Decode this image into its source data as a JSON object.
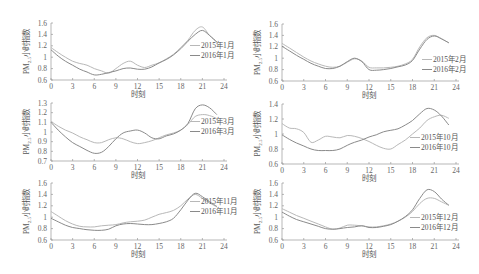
{
  "chart_data": [
    {
      "type": "line",
      "title": "",
      "xlabel": "时刻",
      "ylabel": "PM2.5小时指数",
      "ylim": [
        0.6,
        1.6
      ],
      "yticks": [
        "0.6",
        "0.8",
        "1",
        "1.2",
        "1.4",
        "1.6"
      ],
      "xlim": [
        0,
        24
      ],
      "xticks": [
        "0",
        "3",
        "6",
        "9",
        "12",
        "15",
        "18",
        "21",
        "24"
      ],
      "x": [
        0,
        1,
        2,
        3,
        4,
        5,
        6,
        7,
        8,
        9,
        10,
        11,
        12,
        13,
        14,
        15,
        16,
        17,
        18,
        19,
        20,
        21,
        22,
        23
      ],
      "series": [
        {
          "name": "2015年1月",
          "values": [
            1.17,
            1.08,
            1.0,
            0.93,
            0.89,
            0.86,
            0.8,
            0.76,
            0.72,
            0.8,
            0.89,
            0.93,
            0.86,
            0.82,
            0.86,
            0.9,
            0.97,
            1.05,
            1.17,
            1.3,
            1.47,
            1.53,
            1.38,
            1.26
          ]
        },
        {
          "name": "2016年1月",
          "values": [
            1.13,
            1.02,
            0.93,
            0.86,
            0.79,
            0.74,
            0.69,
            0.7,
            0.73,
            0.76,
            0.8,
            0.81,
            0.79,
            0.79,
            0.83,
            0.9,
            0.96,
            1.04,
            1.15,
            1.28,
            1.4,
            1.47,
            1.38,
            1.27
          ]
        }
      ],
      "legend_position": "right"
    },
    {
      "type": "line",
      "title": "",
      "xlabel": "时刻",
      "ylabel": "PM2.5小时指数",
      "ylim": [
        0.6,
        1.6
      ],
      "yticks": [
        "0.6",
        "0.8",
        "1",
        "1.2",
        "1.4",
        "1.6"
      ],
      "xlim": [
        0,
        24
      ],
      "xticks": [
        "0",
        "3",
        "6",
        "9",
        "12",
        "15",
        "18",
        "21",
        "24"
      ],
      "x": [
        0,
        1,
        2,
        3,
        4,
        5,
        6,
        7,
        8,
        9,
        10,
        11,
        12,
        13,
        14,
        15,
        16,
        17,
        18,
        19,
        20,
        21,
        22,
        23
      ],
      "series": [
        {
          "name": "2015年2月",
          "values": [
            1.26,
            1.18,
            1.1,
            1.02,
            0.95,
            0.9,
            0.86,
            0.84,
            0.86,
            0.93,
            0.99,
            0.95,
            0.84,
            0.83,
            0.83,
            0.84,
            0.86,
            0.9,
            0.98,
            1.2,
            1.36,
            1.4,
            1.34,
            1.27
          ]
        },
        {
          "name": "2016年2月",
          "values": [
            1.21,
            1.13,
            1.05,
            0.98,
            0.91,
            0.86,
            0.82,
            0.82,
            0.86,
            0.94,
            1.0,
            0.94,
            0.8,
            0.79,
            0.8,
            0.82,
            0.85,
            0.88,
            0.96,
            1.16,
            1.33,
            1.39,
            1.34,
            1.27
          ]
        }
      ],
      "legend_position": "right"
    },
    {
      "type": "line",
      "title": "",
      "xlabel": "时刻",
      "ylabel": "PM2.5小时指数",
      "ylim": [
        0.7,
        1.3
      ],
      "yticks": [
        "0.7",
        "0.8",
        "0.9",
        "1",
        "1.1",
        "1.2",
        "1.3"
      ],
      "xlim": [
        0,
        24
      ],
      "xticks": [
        "0",
        "3",
        "6",
        "9",
        "12",
        "15",
        "18",
        "21",
        "24"
      ],
      "x": [
        0,
        1,
        2,
        3,
        4,
        5,
        6,
        7,
        8,
        9,
        10,
        11,
        12,
        13,
        14,
        15,
        16,
        17,
        18,
        19,
        20,
        21,
        22,
        23
      ],
      "series": [
        {
          "name": "2015年3月",
          "values": [
            1.11,
            1.06,
            1.02,
            0.99,
            0.95,
            0.92,
            0.89,
            0.89,
            0.92,
            0.94,
            0.93,
            0.9,
            0.88,
            0.89,
            0.91,
            0.94,
            0.97,
            0.99,
            1.02,
            1.08,
            1.16,
            1.18,
            1.17,
            1.14
          ]
        },
        {
          "name": "2016年3月",
          "values": [
            1.1,
            1.02,
            0.95,
            0.89,
            0.85,
            0.81,
            0.78,
            0.79,
            0.85,
            0.93,
            0.99,
            1.01,
            1.02,
            0.99,
            0.94,
            0.93,
            0.96,
            0.98,
            1.02,
            1.09,
            1.24,
            1.28,
            1.25,
            1.18
          ]
        }
      ],
      "legend_position": "right"
    },
    {
      "type": "line",
      "title": "",
      "xlabel": "时刻",
      "ylabel": "PM2.5小时指数",
      "ylim": [
        0.6,
        1.4
      ],
      "yticks": [
        "0.6",
        "0.8",
        "1",
        "1.2",
        "1.4"
      ],
      "xlim": [
        0,
        24
      ],
      "xticks": [
        "0",
        "3",
        "6",
        "9",
        "12",
        "15",
        "18",
        "21",
        "24"
      ],
      "x": [
        0,
        1,
        2,
        3,
        4,
        5,
        6,
        7,
        8,
        9,
        10,
        11,
        12,
        13,
        14,
        15,
        16,
        17,
        18,
        19,
        20,
        21,
        22,
        23
      ],
      "series": [
        {
          "name": "2015年10月",
          "values": [
            1.14,
            1.08,
            1.07,
            1.02,
            0.89,
            0.92,
            0.97,
            0.96,
            0.95,
            0.98,
            0.97,
            0.94,
            0.9,
            0.85,
            0.81,
            0.8,
            0.86,
            0.92,
            1.0,
            1.08,
            1.18,
            1.23,
            1.25,
            1.21
          ]
        },
        {
          "name": "2016年10月",
          "values": [
            0.99,
            0.93,
            0.88,
            0.84,
            0.8,
            0.78,
            0.78,
            0.78,
            0.8,
            0.85,
            0.89,
            0.92,
            0.96,
            0.99,
            1.03,
            1.05,
            1.07,
            1.12,
            1.18,
            1.27,
            1.34,
            1.32,
            1.24,
            1.12
          ]
        }
      ],
      "legend_position": "right"
    },
    {
      "type": "line",
      "title": "",
      "xlabel": "时刻",
      "ylabel": "PM2.5小时指数",
      "ylim": [
        0.6,
        1.6
      ],
      "yticks": [
        "0.6",
        "0.8",
        "1",
        "1.2",
        "1.4",
        "1.6"
      ],
      "xlim": [
        0,
        24
      ],
      "xticks": [
        "0",
        "3",
        "6",
        "9",
        "12",
        "15",
        "18",
        "21",
        "24"
      ],
      "x": [
        0,
        1,
        2,
        3,
        4,
        5,
        6,
        7,
        8,
        9,
        10,
        11,
        12,
        13,
        14,
        15,
        16,
        17,
        18,
        19,
        20,
        21,
        22,
        23
      ],
      "series": [
        {
          "name": "2015年11月",
          "values": [
            1.1,
            1.02,
            0.94,
            0.88,
            0.84,
            0.83,
            0.83,
            0.85,
            0.86,
            0.87,
            0.9,
            0.92,
            0.93,
            0.95,
            1.0,
            1.05,
            1.08,
            1.12,
            1.2,
            1.32,
            1.4,
            1.33,
            1.25,
            1.18
          ]
        },
        {
          "name": "2016年11月",
          "values": [
            0.98,
            0.92,
            0.86,
            0.82,
            0.8,
            0.78,
            0.77,
            0.77,
            0.79,
            0.85,
            0.88,
            0.89,
            0.88,
            0.87,
            0.87,
            0.89,
            0.92,
            0.98,
            1.13,
            1.3,
            1.42,
            1.36,
            1.27,
            1.19
          ]
        }
      ],
      "legend_position": "right"
    },
    {
      "type": "line",
      "title": "",
      "xlabel": "时刻",
      "ylabel": "PM2.5小时指数",
      "ylim": [
        0.6,
        1.6
      ],
      "yticks": [
        "0.6",
        "0.8",
        "1",
        "1.2",
        "1.4",
        "1.6"
      ],
      "xlim": [
        0,
        24
      ],
      "xticks": [
        "0",
        "3",
        "6",
        "9",
        "12",
        "15",
        "18",
        "21",
        "24"
      ],
      "x": [
        0,
        1,
        2,
        3,
        4,
        5,
        6,
        7,
        8,
        9,
        10,
        11,
        12,
        13,
        14,
        15,
        16,
        17,
        18,
        19,
        20,
        21,
        22,
        23
      ],
      "series": [
        {
          "name": "2015年12月",
          "values": [
            1.15,
            1.09,
            1.03,
            0.98,
            0.93,
            0.88,
            0.83,
            0.79,
            0.81,
            0.86,
            0.86,
            0.85,
            0.83,
            0.83,
            0.85,
            0.88,
            0.93,
            1.0,
            1.1,
            1.24,
            1.33,
            1.33,
            1.27,
            1.21
          ]
        },
        {
          "name": "2016年12月",
          "values": [
            1.09,
            1.02,
            0.96,
            0.92,
            0.88,
            0.84,
            0.8,
            0.79,
            0.8,
            0.82,
            0.83,
            0.85,
            0.82,
            0.82,
            0.84,
            0.87,
            0.93,
            1.01,
            1.13,
            1.33,
            1.48,
            1.45,
            1.32,
            1.21
          ]
        }
      ],
      "legend_position": "right"
    }
  ],
  "panels_layout": [
    {
      "x0": 51,
      "x1": 224,
      "ytop": 23,
      "ybot": 80
    },
    {
      "x0": 282,
      "x1": 456,
      "ytop": 24,
      "ybot": 81
    },
    {
      "x0": 51,
      "x1": 224,
      "ytop": 103,
      "ybot": 161
    },
    {
      "x0": 282,
      "x1": 456,
      "ytop": 104,
      "ybot": 164
    },
    {
      "x0": 51,
      "x1": 224,
      "ytop": 183,
      "ybot": 240
    },
    {
      "x0": 282,
      "x1": 456,
      "ytop": 183,
      "ybot": 240
    }
  ],
  "legend_offsets": [
    {
      "x": 190,
      "y": 48
    },
    {
      "x": 422,
      "y": 62
    },
    {
      "x": 190,
      "y": 124
    },
    {
      "x": 410,
      "y": 140
    },
    {
      "x": 190,
      "y": 204
    },
    {
      "x": 410,
      "y": 220
    }
  ]
}
